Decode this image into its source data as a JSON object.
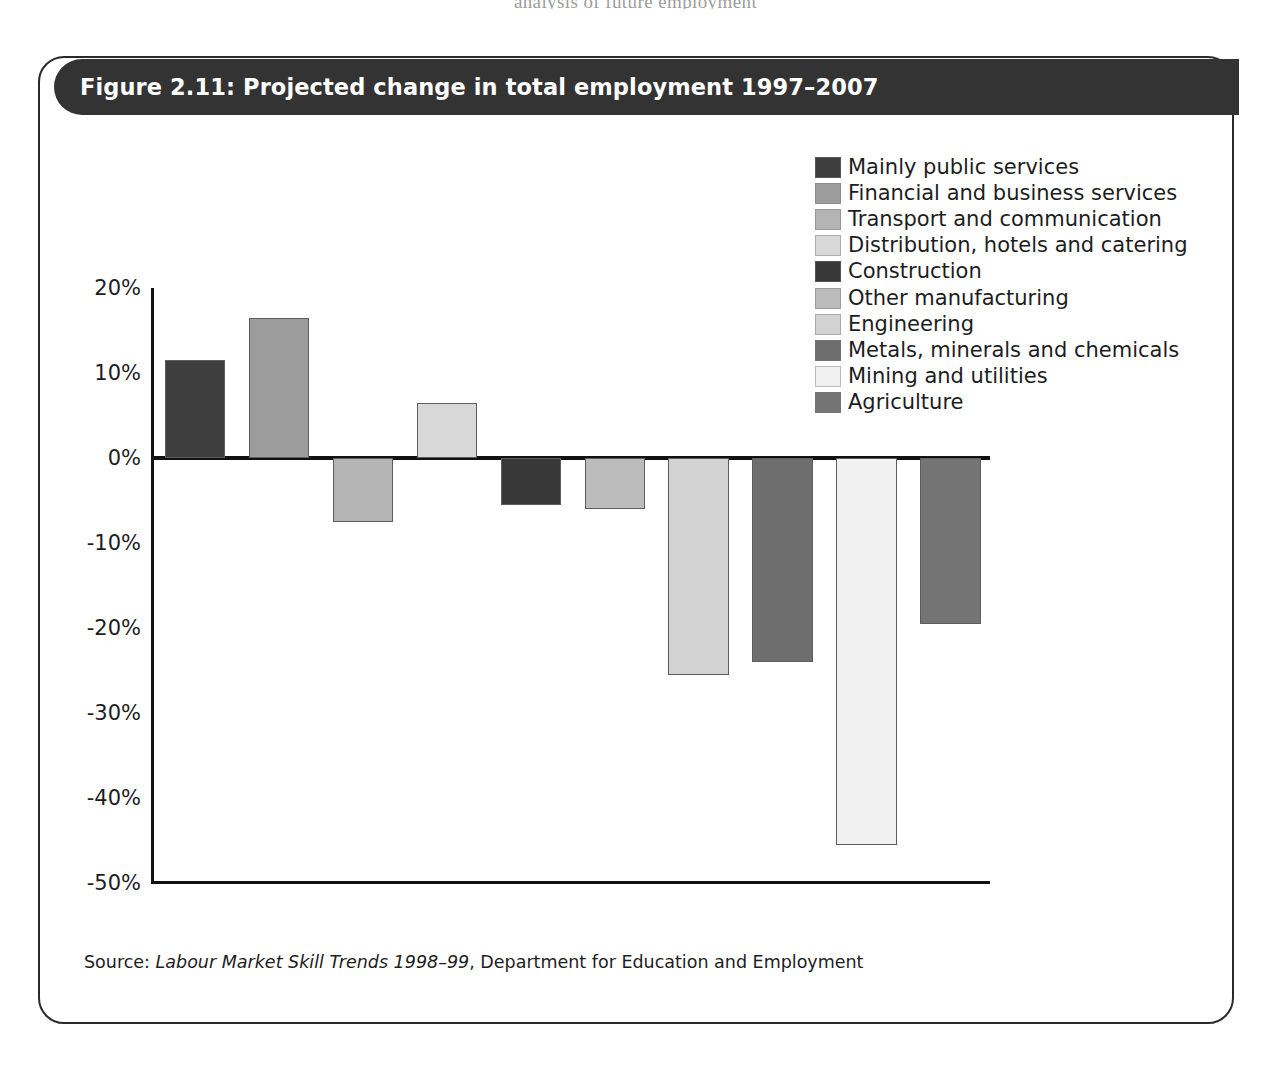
{
  "page_bleed_text": "analysis of future employment",
  "figure": {
    "title": "Figure 2.11: Projected change in total employment 1997–2007",
    "source_prefix": "Source: ",
    "source_italic": "Labour Market Skill Trends 1998–99",
    "source_suffix": ", Department for Education and Employment"
  },
  "chart_data": {
    "type": "bar",
    "title": "Figure 2.11: Projected change in total employment 1997–2007",
    "xlabel": "",
    "ylabel": "",
    "ylim": [
      -50,
      20
    ],
    "yticks": [
      20,
      10,
      0,
      -10,
      -20,
      -30,
      -40,
      -50
    ],
    "ytick_labels": [
      "20%",
      "10%",
      "0%",
      "-10%",
      "-20%",
      "-30%",
      "-40%",
      "-50%"
    ],
    "grid": false,
    "legend_position": "top-right",
    "units": "percent",
    "categories": [
      "Mainly public services",
      "Financial and business services",
      "Transport and communication",
      "Distribution, hotels and catering",
      "Construction",
      "Other manufacturing",
      "Engineering",
      "Metals, minerals and chemicals",
      "Mining and utilities",
      "Agriculture"
    ],
    "values": [
      11.5,
      16.5,
      -7.5,
      6.5,
      -5.5,
      -6.0,
      -25.5,
      -24.0,
      -45.5,
      -19.5
    ],
    "colors": [
      "#3e3e3e",
      "#9c9c9c",
      "#b4b4b4",
      "#d8d8d8",
      "#383838",
      "#bcbcbc",
      "#d2d2d2",
      "#6e6e6e",
      "#f0f0f0",
      "#747474"
    ],
    "series": [
      {
        "name": "Projected change in total employment 1997–2007",
        "values": [
          11.5,
          16.5,
          -7.5,
          6.5,
          -5.5,
          -6.0,
          -25.5,
          -24.0,
          -45.5,
          -19.5
        ]
      }
    ]
  },
  "theme": {
    "title_bar_bg": "#333333",
    "title_bar_fg": "#ffffff",
    "frame_border": "#2a2a2a",
    "axis_color": "#111111",
    "text_color": "#1d1d1d"
  }
}
